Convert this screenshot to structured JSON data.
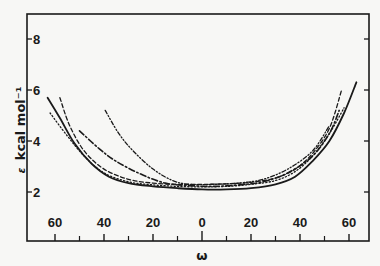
{
  "chart_data": {
    "type": "line",
    "title": "",
    "xlabel": "ω",
    "ylabel": "ε kcal mol⁻¹",
    "xlim": [
      -68,
      68
    ],
    "ylim": [
      0,
      9
    ],
    "x_ticks": [
      -60,
      -40,
      -20,
      0,
      20,
      40,
      60
    ],
    "x_tick_labels": [
      "60",
      "40",
      "20",
      "0",
      "20",
      "40",
      "60"
    ],
    "x_minor_ticks": [
      -50,
      -30,
      -10,
      10,
      30,
      50
    ],
    "y_ticks": [
      2,
      4,
      6,
      8
    ],
    "y_tick_labels": [
      "2",
      "4",
      "6",
      "8"
    ],
    "grid": false,
    "legend": null,
    "series": [
      {
        "name": "solid",
        "style": "solid",
        "points": [
          [
            -63,
            5.7
          ],
          [
            -58,
            4.9
          ],
          [
            -52,
            3.9
          ],
          [
            -45,
            3.1
          ],
          [
            -38,
            2.6
          ],
          [
            -30,
            2.35
          ],
          [
            -20,
            2.22
          ],
          [
            -10,
            2.15
          ],
          [
            0,
            2.1
          ],
          [
            10,
            2.1
          ],
          [
            20,
            2.15
          ],
          [
            30,
            2.3
          ],
          [
            38,
            2.6
          ],
          [
            45,
            3.2
          ],
          [
            52,
            4.0
          ],
          [
            58,
            5.1
          ],
          [
            63,
            6.3
          ]
        ]
      },
      {
        "name": "dotted",
        "style": "dotted",
        "points": [
          [
            -62,
            5.1
          ],
          [
            -55,
            4.2
          ],
          [
            -48,
            3.4
          ],
          [
            -40,
            2.75
          ],
          [
            -30,
            2.4
          ],
          [
            -20,
            2.28
          ],
          [
            -10,
            2.22
          ],
          [
            0,
            2.2
          ],
          [
            10,
            2.22
          ],
          [
            20,
            2.3
          ],
          [
            30,
            2.45
          ],
          [
            38,
            2.8
          ],
          [
            45,
            3.4
          ],
          [
            52,
            4.3
          ],
          [
            58,
            5.3
          ]
        ]
      },
      {
        "name": "dashed",
        "style": "dashed",
        "points": [
          [
            -58,
            5.7
          ],
          [
            -54,
            4.6
          ],
          [
            -48,
            3.6
          ],
          [
            -40,
            2.9
          ],
          [
            -30,
            2.5
          ],
          [
            -20,
            2.35
          ],
          [
            -10,
            2.3
          ],
          [
            0,
            2.3
          ],
          [
            10,
            2.32
          ],
          [
            20,
            2.38
          ],
          [
            30,
            2.55
          ],
          [
            38,
            2.9
          ],
          [
            45,
            3.5
          ],
          [
            52,
            4.5
          ],
          [
            57,
            6.0
          ]
        ]
      },
      {
        "name": "dash-dot",
        "style": "dashdot",
        "points": [
          [
            -50,
            4.4
          ],
          [
            -42,
            3.7
          ],
          [
            -35,
            3.2
          ],
          [
            -25,
            2.7
          ],
          [
            -15,
            2.35
          ],
          [
            -5,
            2.25
          ],
          [
            5,
            2.22
          ],
          [
            15,
            2.28
          ],
          [
            25,
            2.4
          ],
          [
            35,
            2.75
          ],
          [
            45,
            3.4
          ],
          [
            52,
            4.3
          ],
          [
            56,
            5.2
          ]
        ]
      },
      {
        "name": "dash-dot-dot",
        "style": "dashdotdot",
        "points": [
          [
            -39.5,
            5.2
          ],
          [
            -34,
            4.3
          ],
          [
            -28,
            3.6
          ],
          [
            -20,
            2.9
          ],
          [
            -12,
            2.45
          ],
          [
            -5,
            2.3
          ],
          [
            5,
            2.3
          ],
          [
            15,
            2.35
          ],
          [
            25,
            2.5
          ],
          [
            35,
            2.9
          ],
          [
            45,
            3.6
          ],
          [
            52,
            4.6
          ]
        ]
      }
    ]
  },
  "colors": {
    "background": "#f7f7f5",
    "ink": "#1a1a1a"
  },
  "axes": {
    "xlabel": "ω",
    "ylabel_symbol": "ε",
    "ylabel_text": "kcal mol⁻¹"
  }
}
